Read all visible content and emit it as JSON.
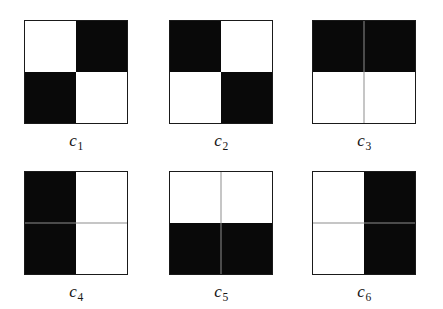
{
  "figure": {
    "background_color": "#ffffff",
    "ink_color": "#090909",
    "border_color": "#1a1a1a",
    "rows": 2,
    "columns": 3,
    "square_size_px": 104
  },
  "patterns": [
    {
      "id": "c1",
      "label_letter": "c",
      "label_index": "1",
      "quadrants": {
        "top_left": "white",
        "top_right": "black",
        "bottom_left": "black",
        "bottom_right": "white"
      },
      "description": "diagonal checker: white / black over black / white",
      "divider_vertical": "none",
      "divider_horizontal": "none"
    },
    {
      "id": "c2",
      "label_letter": "c",
      "label_index": "2",
      "quadrants": {
        "top_left": "black",
        "top_right": "white",
        "bottom_left": "white",
        "bottom_right": "black"
      },
      "description": "anti-diagonal checker: black / white over white / black",
      "divider_vertical": "none",
      "divider_horizontal": "none"
    },
    {
      "id": "c3",
      "label_letter": "c",
      "label_index": "3",
      "quadrants": {
        "top_left": "black",
        "top_right": "black",
        "bottom_left": "white",
        "bottom_right": "white"
      },
      "description": "horizontal split: top half black, bottom half white",
      "divider_vertical": "light",
      "divider_horizontal": "none"
    },
    {
      "id": "c4",
      "label_letter": "c",
      "label_index": "4",
      "quadrants": {
        "top_left": "black",
        "top_right": "white",
        "bottom_left": "black",
        "bottom_right": "white"
      },
      "description": "vertical split: left half black, right half white",
      "divider_vertical": "none",
      "divider_horizontal": "light"
    },
    {
      "id": "c5",
      "label_letter": "c",
      "label_index": "5",
      "quadrants": {
        "top_left": "white",
        "top_right": "white",
        "bottom_left": "black",
        "bottom_right": "black"
      },
      "description": "horizontal split: top half white, bottom half black",
      "divider_vertical": "light",
      "divider_horizontal": "none"
    },
    {
      "id": "c6",
      "label_letter": "c",
      "label_index": "6",
      "quadrants": {
        "top_left": "white",
        "top_right": "black",
        "bottom_left": "white",
        "bottom_right": "black"
      },
      "description": "vertical split: left half white, right half black",
      "divider_vertical": "none",
      "divider_horizontal": "light"
    }
  ]
}
